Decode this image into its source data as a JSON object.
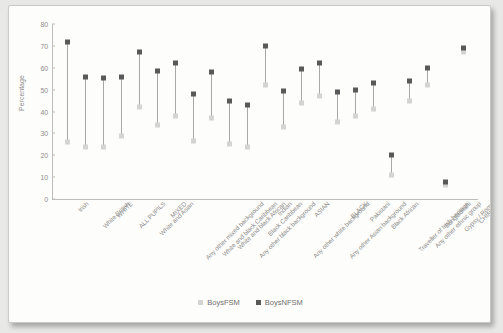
{
  "chart_data": {
    "type": "scatter",
    "title": "",
    "xlabel": "",
    "ylabel": "Percentage",
    "ylim": [
      0,
      80
    ],
    "yticks": [
      0,
      10,
      20,
      30,
      40,
      50,
      60,
      70,
      80
    ],
    "grid": false,
    "legend_position": "bottom-center",
    "categories": [
      "Irish",
      "White British",
      "WHITE",
      "ALL PUPILS",
      "White and Asian",
      "MIXED",
      "Any other mixed background",
      "White and black Caribbean",
      "White and black African",
      "Any other black background",
      "Black Caribbean",
      "Indian",
      "Any other white background",
      "ASIAN",
      "Any other Asian background",
      "BLACK",
      "Pakistani",
      "Black African",
      "Traveller of Irish heritage",
      "Any other ethnic group",
      "Bangladeshi",
      "Gypsy / Roma",
      "CHINESE"
    ],
    "series": [
      {
        "name": "BoysFSM",
        "color": "#d4d4d2",
        "values": [
          26,
          24,
          24,
          29,
          42,
          34,
          38,
          26.5,
          37,
          25,
          24,
          52,
          33,
          44,
          47,
          35,
          38,
          41,
          11,
          45,
          52,
          6.5,
          67
        ]
      },
      {
        "name": "BoysNFSM",
        "color": "#595959",
        "values": [
          72,
          56,
          55.5,
          56,
          67,
          58.5,
          62,
          48,
          58,
          45,
          43,
          70,
          49.5,
          59.5,
          62,
          49,
          50,
          53,
          20,
          54,
          60,
          8,
          69
        ]
      }
    ]
  },
  "legend": {
    "items": [
      {
        "label": "BoysFSM",
        "color": "#d4d4d2"
      },
      {
        "label": "BoysNFSM",
        "color": "#595959"
      }
    ]
  }
}
